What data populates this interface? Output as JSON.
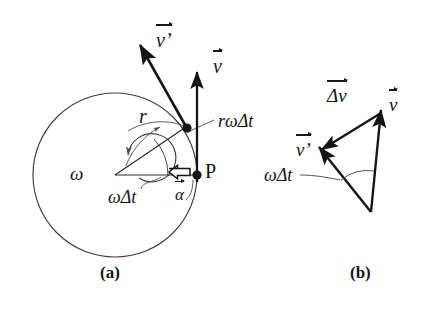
{
  "figure": {
    "background_color": "#ffffff",
    "stroke_color": "#151515",
    "thin_stroke_color": "#4a4a4a"
  },
  "panels": [
    {
      "id": "a",
      "caption": "(a)",
      "caption_x": 104,
      "caption_y": 272,
      "description": "Circle with radius r, rotating point P, velocity vectors v and v-prime, angle omega delta t, and centripetal acceleration alpha"
    },
    {
      "id": "b",
      "caption": "(b)",
      "caption_x": 354,
      "caption_y": 272,
      "description": "Vector triangle showing v, v-prime and their difference delta v subtending angle omega delta t"
    }
  ],
  "panel_a": {
    "circle": {
      "cx": 115,
      "cy": 175,
      "r": 82
    },
    "center_spiral": {
      "cx": 115,
      "cy": 175,
      "r": 24
    },
    "point_p": {
      "x": 197,
      "y": 175,
      "label": "P",
      "label_x": 206,
      "label_y": 166
    },
    "point_q": {
      "x": 186,
      "y": 127
    },
    "labels": {
      "omega": "ω",
      "omega_x": 72,
      "omega_y": 173,
      "omega_delta_t": "ωΔt",
      "omega_delta_t_x": 110,
      "omega_delta_t_y": 192,
      "radius": "r",
      "radius_x": 139,
      "radius_y": 118,
      "arc_length": "rωΔt",
      "arc_length_x": 219,
      "arc_length_y": 122,
      "alpha": "α",
      "alpha_x": 177,
      "alpha_y": 184,
      "v": "v",
      "v_x": 213,
      "v_y": 61,
      "v_prime": "v’",
      "v_prime_x": 156,
      "v_prime_y": 36
    }
  },
  "panel_b": {
    "vertices": {
      "top_right": {
        "x": 381,
        "y": 113
      },
      "left": {
        "x": 322,
        "y": 152
      },
      "bottom": {
        "x": 371,
        "y": 212
      }
    },
    "labels": {
      "delta_v": "Δv",
      "delta_v_x": 330,
      "delta_v_y": 93,
      "v": "v",
      "v_x": 390,
      "v_y": 101,
      "v_prime": "v’",
      "v_prime_x": 299,
      "v_prime_y": 147,
      "omega_delta_t": "ωΔt",
      "omega_delta_t_x": 268,
      "omega_delta_t_y": 172
    }
  }
}
